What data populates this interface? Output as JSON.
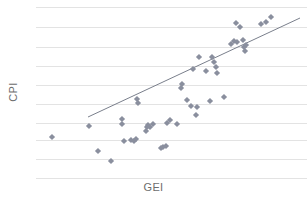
{
  "chart_data": {
    "type": "scatter",
    "title": "",
    "xlabel": "GEI",
    "ylabel": "CPI",
    "grid": true,
    "legend": null,
    "xlim": [
      0,
      100
    ],
    "ylim": [
      0,
      100
    ],
    "xticklabels": [],
    "yticklabels": [],
    "gridlines_y": [
      7,
      27,
      47,
      66,
      85,
      104,
      123,
      140,
      159,
      178
    ],
    "marker": "diamond",
    "marker_color": "#8a8f9e",
    "marker_size": 5,
    "points": [
      [
        52,
        137
      ],
      [
        98,
        151
      ],
      [
        89,
        126
      ],
      [
        111,
        161
      ],
      [
        122,
        119
      ],
      [
        122,
        124
      ],
      [
        124,
        141
      ],
      [
        131,
        140
      ],
      [
        134,
        141
      ],
      [
        136,
        139
      ],
      [
        137,
        99
      ],
      [
        138,
        103
      ],
      [
        146,
        131
      ],
      [
        147,
        127
      ],
      [
        148,
        125
      ],
      [
        150,
        127
      ],
      [
        153,
        124
      ],
      [
        161,
        148
      ],
      [
        163,
        147
      ],
      [
        166,
        146
      ],
      [
        167,
        123
      ],
      [
        170,
        120
      ],
      [
        177,
        124
      ],
      [
        181,
        88
      ],
      [
        182,
        84
      ],
      [
        187,
        100
      ],
      [
        191,
        106
      ],
      [
        193,
        69
      ],
      [
        196,
        115
      ],
      [
        197,
        107
      ],
      [
        199,
        57
      ],
      [
        206,
        71
      ],
      [
        210,
        101
      ],
      [
        212,
        57
      ],
      [
        214,
        62
      ],
      [
        216,
        67
      ],
      [
        217,
        73
      ],
      [
        224,
        97
      ],
      [
        231,
        44
      ],
      [
        234,
        41
      ],
      [
        236,
        23
      ],
      [
        237,
        42
      ],
      [
        240,
        27
      ],
      [
        243,
        40
      ],
      [
        244,
        47
      ],
      [
        245,
        51
      ],
      [
        246,
        45
      ],
      [
        261,
        24
      ],
      [
        266,
        22
      ],
      [
        271,
        17
      ]
    ],
    "trendline": {
      "x0": 88,
      "y0": 117,
      "x1": 300,
      "y1": 18,
      "color": "#7a7f8c",
      "width": 1
    },
    "colors": {
      "gridline": "#e3e3e3",
      "background": "#ffffff",
      "axis_label": "#6d6d6d",
      "marker": "#8a8f9e",
      "trendline": "#7a7f8c"
    }
  }
}
